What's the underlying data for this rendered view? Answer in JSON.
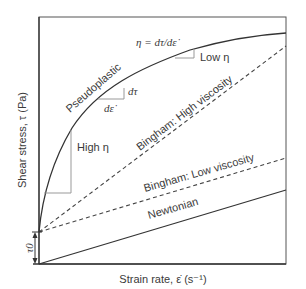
{
  "axes": {
    "ylabel": "Shear stress, τ (Pa)",
    "xlabel": "Strain rate, ε̇ (s⁻¹)",
    "yield_label": "τ0"
  },
  "curves": {
    "pseudoplastic": "Pseudoplastic",
    "bingham_high": "Bingham: High viscosity",
    "bingham_low": "Bingham: Low viscosity",
    "newtonian": "Newtonian"
  },
  "annotations": {
    "viscosity_def": "η = dτ/dε̇",
    "low_eta": "Low η",
    "high_eta": "High η",
    "d_tau": "dτ",
    "d_eps": "dε̇"
  },
  "colors": {
    "line": "#333333",
    "guide": "#8a8a8a",
    "frame": "#444444"
  }
}
